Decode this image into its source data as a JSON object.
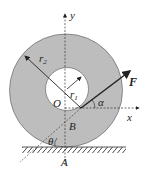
{
  "labels": {
    "y": "y",
    "x": "x",
    "F": "F",
    "O": "O",
    "r1": "r",
    "r1_sub": "1",
    "r2": "r",
    "r2_sub": "2",
    "alpha": "α",
    "theta": "θ",
    "B": "B",
    "A": "A"
  },
  "colors": {
    "ring_fill": "#bdbdbd",
    "ground_hatch": "#444444",
    "line": "#222222"
  }
}
